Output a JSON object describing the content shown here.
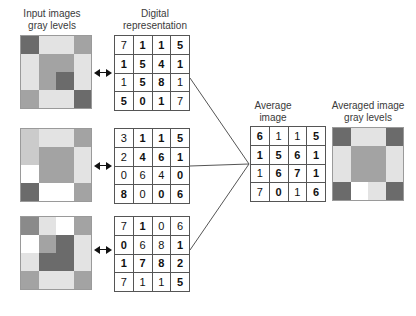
{
  "headers": {
    "input_images": "Input images\ngray levels",
    "digital_representation": "Digital\nrepresentation",
    "average_image": "Average\nimage",
    "averaged_image": "Averaged image\ngray levels"
  },
  "colors": {
    "background": "#ffffff",
    "grid_line": "#555555",
    "image_border": "#9a9a9a",
    "text": "#3a3a3a",
    "number": "#111111",
    "connector": "#555555",
    "arrow": "#111111",
    "tone_white": "#ffffff",
    "tone_light": "#e3e3e3",
    "tone_medium_light": "#cbcbcb",
    "tone_medium": "#a3a3a3",
    "tone_medium_dark": "#8a8a8a",
    "tone_dark": "#6b6b6b"
  },
  "input_images": [
    {
      "name": "input-image-1",
      "tones": [
        [
          "#6b6b6b",
          "#e3e3e3",
          "#e3e3e3",
          "#a3a3a3"
        ],
        [
          "#e3e3e3",
          "#a3a3a3",
          "#a3a3a3",
          "#e3e3e3"
        ],
        [
          "#e3e3e3",
          "#a3a3a3",
          "#6b6b6b",
          "#e3e3e3"
        ],
        [
          "#a3a3a3",
          "#e3e3e3",
          "#e3e3e3",
          "#6b6b6b"
        ]
      ]
    },
    {
      "name": "input-image-2",
      "tones": [
        [
          "#cbcbcb",
          "#e3e3e3",
          "#e3e3e3",
          "#a3a3a3"
        ],
        [
          "#cbcbcb",
          "#a3a3a3",
          "#a3a3a3",
          "#e3e3e3"
        ],
        [
          "#ffffff",
          "#a3a3a3",
          "#a3a3a3",
          "#e3e3e3"
        ],
        [
          "#6b6b6b",
          "#ffffff",
          "#ffffff",
          "#a3a3a3"
        ]
      ]
    },
    {
      "name": "input-image-3",
      "tones": [
        [
          "#8a8a8a",
          "#e3e3e3",
          "#ffffff",
          "#a3a3a3"
        ],
        [
          "#ffffff",
          "#a3a3a3",
          "#6b6b6b",
          "#e3e3e3"
        ],
        [
          "#e3e3e3",
          "#6b6b6b",
          "#6b6b6b",
          "#e3e3e3"
        ],
        [
          "#a3a3a3",
          "#e3e3e3",
          "#e3e3e3",
          "#a3a3a3"
        ]
      ]
    }
  ],
  "averaged_image": {
    "name": "averaged-image",
    "tones": [
      [
        "#6b6b6b",
        "#e3e3e3",
        "#e3e3e3",
        "#6b6b6b"
      ],
      [
        "#e3e3e3",
        "#a3a3a3",
        "#a3a3a3",
        "#e3e3e3"
      ],
      [
        "#e3e3e3",
        "#a3a3a3",
        "#a3a3a3",
        "#e3e3e3"
      ],
      [
        "#6b6b6b",
        "#ffffff",
        "#e3e3e3",
        "#6b6b6b"
      ]
    ]
  },
  "matrices": [
    {
      "name": "digital-matrix-1",
      "values": [
        [
          "7",
          "1",
          "1",
          "5"
        ],
        [
          "1",
          "5",
          "4",
          "1"
        ],
        [
          "1",
          "5",
          "8",
          "1"
        ],
        [
          "5",
          "0",
          "1",
          "7"
        ]
      ],
      "bold": [
        [
          false,
          true,
          true,
          true
        ],
        [
          true,
          true,
          true,
          true
        ],
        [
          false,
          true,
          true,
          false
        ],
        [
          true,
          true,
          true,
          false
        ]
      ]
    },
    {
      "name": "digital-matrix-2",
      "values": [
        [
          "3",
          "1",
          "1",
          "5"
        ],
        [
          "2",
          "4",
          "6",
          "1"
        ],
        [
          "0",
          "6",
          "4",
          "0"
        ],
        [
          "8",
          "0",
          "0",
          "6"
        ]
      ],
      "bold": [
        [
          false,
          true,
          true,
          true
        ],
        [
          false,
          true,
          true,
          true
        ],
        [
          false,
          false,
          false,
          true
        ],
        [
          true,
          false,
          true,
          true
        ]
      ]
    },
    {
      "name": "digital-matrix-3",
      "values": [
        [
          "7",
          "1",
          "0",
          "6"
        ],
        [
          "0",
          "6",
          "8",
          "1"
        ],
        [
          "1",
          "7",
          "8",
          "2"
        ],
        [
          "7",
          "1",
          "1",
          "5"
        ]
      ],
      "bold": [
        [
          false,
          true,
          false,
          false
        ],
        [
          true,
          false,
          false,
          true
        ],
        [
          true,
          true,
          true,
          true
        ],
        [
          false,
          false,
          false,
          true
        ]
      ]
    }
  ],
  "average_matrix": {
    "name": "average-matrix",
    "values": [
      [
        "6",
        "1",
        "1",
        "5"
      ],
      [
        "1",
        "5",
        "6",
        "1"
      ],
      [
        "1",
        "6",
        "7",
        "1"
      ],
      [
        "7",
        "0",
        "1",
        "6"
      ]
    ],
    "bold": [
      [
        true,
        false,
        false,
        true
      ],
      [
        true,
        true,
        true,
        true
      ],
      [
        false,
        true,
        true,
        true
      ],
      [
        false,
        true,
        false,
        true
      ]
    ]
  }
}
